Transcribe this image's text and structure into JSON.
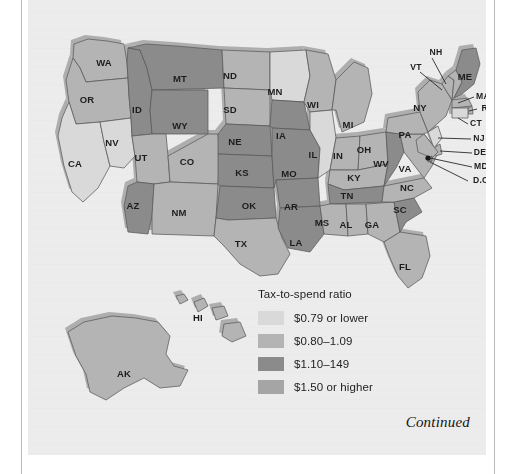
{
  "figure": {
    "footer_note": "Continued",
    "legend": {
      "title": "Tax-to-spend ratio",
      "bins": [
        {
          "label": "$0.79 or lower",
          "color": "#d9d9d9"
        },
        {
          "label": "$0.80–1.09",
          "color": "#b4b4b4"
        },
        {
          "label": "$1.10–149",
          "color": "#8b8b8b"
        },
        {
          "label": "$1.50 or higher",
          "color": "#a5a5a5"
        }
      ]
    }
  },
  "chart_data": {
    "type": "map",
    "title": "Tax-to-spend ratio",
    "subtitle": "",
    "xlabel": "",
    "ylabel": "",
    "legend_position": "inset-bottom-right",
    "grid": false,
    "categories": [
      "$0.79 or lower",
      "$0.80–1.09",
      "$1.10–149",
      "$1.50 or higher"
    ],
    "bin_colors": [
      "#d9d9d9",
      "#b4b4b4",
      "#8b8b8b",
      "#a5a5a5"
    ],
    "regions": [
      {
        "code": "WA",
        "bin": 1
      },
      {
        "code": "OR",
        "bin": 1
      },
      {
        "code": "CA",
        "bin": 0
      },
      {
        "code": "NV",
        "bin": 0
      },
      {
        "code": "ID",
        "bin": 2
      },
      {
        "code": "MT",
        "bin": 2
      },
      {
        "code": "WY",
        "bin": 2
      },
      {
        "code": "UT",
        "bin": 1
      },
      {
        "code": "CO",
        "bin": 1
      },
      {
        "code": "AZ",
        "bin": 2
      },
      {
        "code": "NM",
        "bin": 1
      },
      {
        "code": "ND",
        "bin": 1
      },
      {
        "code": "SD",
        "bin": 1
      },
      {
        "code": "NE",
        "bin": 2
      },
      {
        "code": "KS",
        "bin": 2
      },
      {
        "code": "OK",
        "bin": 2
      },
      {
        "code": "TX",
        "bin": 1
      },
      {
        "code": "MN",
        "bin": 0
      },
      {
        "code": "IA",
        "bin": 2
      },
      {
        "code": "MO",
        "bin": 2
      },
      {
        "code": "AR",
        "bin": 2
      },
      {
        "code": "LA",
        "bin": 2
      },
      {
        "code": "WI",
        "bin": 1
      },
      {
        "code": "IL",
        "bin": 0
      },
      {
        "code": "MI",
        "bin": 1
      },
      {
        "code": "IN",
        "bin": 1
      },
      {
        "code": "OH",
        "bin": 1
      },
      {
        "code": "KY",
        "bin": 1
      },
      {
        "code": "TN",
        "bin": 2
      },
      {
        "code": "MS",
        "bin": 1
      },
      {
        "code": "AL",
        "bin": 1
      },
      {
        "code": "GA",
        "bin": 1
      },
      {
        "code": "FL",
        "bin": 1
      },
      {
        "code": "SC",
        "bin": 2
      },
      {
        "code": "NC",
        "bin": 1
      },
      {
        "code": "VA",
        "bin": 1
      },
      {
        "code": "WV",
        "bin": 2
      },
      {
        "code": "PA",
        "bin": 1
      },
      {
        "code": "NY",
        "bin": 1
      },
      {
        "code": "VT",
        "bin": 1
      },
      {
        "code": "NH",
        "bin": 1
      },
      {
        "code": "ME",
        "bin": 2
      },
      {
        "code": "MA",
        "bin": 1
      },
      {
        "code": "RI",
        "bin": 1
      },
      {
        "code": "CT",
        "bin": 0
      },
      {
        "code": "NJ",
        "bin": 0
      },
      {
        "code": "DE",
        "bin": 1
      },
      {
        "code": "MD",
        "bin": 1
      },
      {
        "code": "D.C.",
        "bin": 2
      },
      {
        "code": "AK",
        "bin": 1
      },
      {
        "code": "HI",
        "bin": 1
      }
    ]
  },
  "map": {
    "labels_inline": [
      {
        "code": "WA",
        "x": 76,
        "y": 57
      },
      {
        "code": "OR",
        "x": 59,
        "y": 94
      },
      {
        "code": "CA",
        "x": 47,
        "y": 158
      },
      {
        "code": "NV",
        "x": 84,
        "y": 137
      },
      {
        "code": "ID",
        "x": 109,
        "y": 104
      },
      {
        "code": "MT",
        "x": 152,
        "y": 73
      },
      {
        "code": "WY",
        "x": 152,
        "y": 120
      },
      {
        "code": "UT",
        "x": 113,
        "y": 152
      },
      {
        "code": "CO",
        "x": 159,
        "y": 156
      },
      {
        "code": "AZ",
        "x": 105,
        "y": 200
      },
      {
        "code": "NM",
        "x": 151,
        "y": 207
      },
      {
        "code": "ND",
        "x": 202,
        "y": 70
      },
      {
        "code": "SD",
        "x": 202,
        "y": 104
      },
      {
        "code": "NE",
        "x": 207,
        "y": 136
      },
      {
        "code": "KS",
        "x": 214,
        "y": 167
      },
      {
        "code": "OK",
        "x": 221,
        "y": 200
      },
      {
        "code": "TX",
        "x": 213,
        "y": 238
      },
      {
        "code": "MN",
        "x": 247,
        "y": 86
      },
      {
        "code": "IA",
        "x": 253,
        "y": 130
      },
      {
        "code": "MO",
        "x": 261,
        "y": 168
      },
      {
        "code": "AR",
        "x": 263,
        "y": 201
      },
      {
        "code": "LA",
        "x": 268,
        "y": 237
      },
      {
        "code": "WI",
        "x": 285,
        "y": 99
      },
      {
        "code": "IL",
        "x": 285,
        "y": 149
      },
      {
        "code": "MI",
        "x": 320,
        "y": 119
      },
      {
        "code": "IN",
        "x": 310,
        "y": 150
      },
      {
        "code": "OH",
        "x": 336,
        "y": 144
      },
      {
        "code": "KY",
        "x": 326,
        "y": 172
      },
      {
        "code": "TN",
        "x": 319,
        "y": 190
      },
      {
        "code": "MS",
        "x": 294,
        "y": 217
      },
      {
        "code": "AL",
        "x": 318,
        "y": 219
      },
      {
        "code": "GA",
        "x": 344,
        "y": 219
      },
      {
        "code": "FL",
        "x": 377,
        "y": 261
      },
      {
        "code": "SC",
        "x": 372,
        "y": 204
      },
      {
        "code": "NC",
        "x": 379,
        "y": 182
      },
      {
        "code": "WV",
        "x": 353,
        "y": 158
      },
      {
        "code": "VA",
        "x": 377,
        "y": 163
      },
      {
        "code": "PA",
        "x": 377,
        "y": 129
      },
      {
        "code": "NY",
        "x": 392,
        "y": 102
      },
      {
        "code": "ME",
        "x": 437,
        "y": 71
      },
      {
        "code": "HI",
        "x": 170,
        "y": 312
      },
      {
        "code": "AK",
        "x": 96,
        "y": 368
      }
    ],
    "labels_leader": [
      {
        "code": "NH",
        "x": 408,
        "y": 47
      },
      {
        "code": "VT",
        "x": 388,
        "y": 62
      },
      {
        "code": "MA",
        "x": 455,
        "y": 91
      },
      {
        "code": "RI",
        "x": 458,
        "y": 103
      },
      {
        "code": "CT",
        "x": 448,
        "y": 118
      },
      {
        "code": "NJ",
        "x": 451,
        "y": 133
      },
      {
        "code": "DE",
        "x": 452,
        "y": 147
      },
      {
        "code": "MD",
        "x": 453,
        "y": 161
      },
      {
        "code": "D.C.",
        "x": 454,
        "y": 175
      }
    ]
  }
}
